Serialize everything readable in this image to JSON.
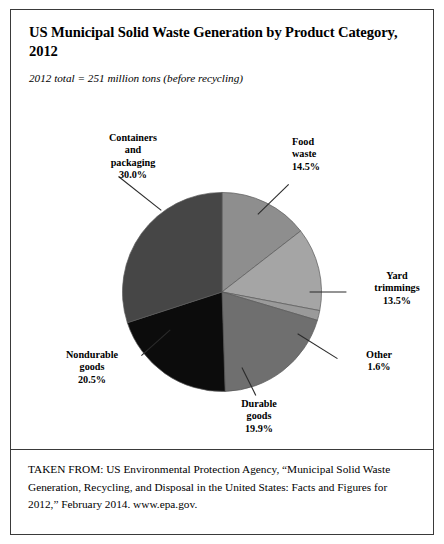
{
  "chart_data": {
    "type": "pie",
    "title": "US Municipal Solid Waste Generation by Product Category, 2012",
    "subtitle": "2012 total = 251 million tons (before recycling)",
    "units": "percent of total",
    "total_label": "251 million tons",
    "legend": "none (direct labels with leader lines)",
    "start_angle_deg": 0,
    "direction": "clockwise",
    "categories": [
      "Food waste",
      "Yard trimmings",
      "Other",
      "Durable goods",
      "Nondurable goods",
      "Containers and packaging"
    ],
    "values": [
      14.5,
      13.5,
      1.6,
      19.9,
      20.5,
      30.0
    ],
    "slices": [
      {
        "label": "Food waste",
        "label_line1": "Food",
        "label_line2": "waste",
        "pct": 14.5,
        "pct_text": "14.5%",
        "color": "#8e8e8e"
      },
      {
        "label": "Yard trimmings",
        "label_line1": "Yard",
        "label_line2": "trimmings",
        "pct": 13.5,
        "pct_text": "13.5%",
        "color": "#a5a5a5"
      },
      {
        "label": "Other",
        "label_line1": "Other",
        "label_line2": "",
        "pct": 1.6,
        "pct_text": "1.6%",
        "color": "#9a9a9a"
      },
      {
        "label": "Durable goods",
        "label_line1": "Durable",
        "label_line2": "goods",
        "pct": 19.9,
        "pct_text": "19.9%",
        "color": "#6f6f6f"
      },
      {
        "label": "Nondurable goods",
        "label_line1": "Nondurable",
        "label_line2": "goods",
        "pct": 20.5,
        "pct_text": "20.5%",
        "color": "#0c0c0c"
      },
      {
        "label": "Containers and packaging",
        "label_line1": "Containers",
        "label_line2": "and",
        "label_line3": "packaging",
        "pct": 30.0,
        "pct_text": "30.0%",
        "color": "#464646"
      }
    ]
  },
  "header": {
    "title": "US Municipal Solid Waste Generation by Product Category, 2012",
    "subtitle": "2012 total = 251 million tons (before recycling)"
  },
  "labels": {
    "containers": {
      "line1": "Containers",
      "line2": "and",
      "line3": "packaging",
      "pct": "30.0%"
    },
    "food": {
      "line1": "Food",
      "line2": "waste",
      "pct": "14.5%"
    },
    "yard": {
      "line1": "Yard",
      "line2": "trimmings",
      "pct": "13.5%"
    },
    "other": {
      "line1": "Other",
      "pct": "1.6%"
    },
    "durable": {
      "line1": "Durable",
      "line2": "goods",
      "pct": "19.9%"
    },
    "nondurable": {
      "line1": "Nondurable",
      "line2": "goods",
      "pct": "20.5%"
    }
  },
  "citation": {
    "text": "TAKEN FROM: US Environmental Protection Agency, “Municipal Solid Waste Generation, Recycling, and Disposal in the United States: Facts and Figures for 2012,” February 2014. www.epa.gov."
  }
}
